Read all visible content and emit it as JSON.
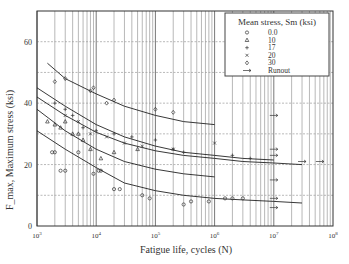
{
  "chart_data": {
    "type": "scatter",
    "title": "",
    "xlabel": "Fatigue life, cycles (N)",
    "ylabel": "F_max, Maximum stress (ksi)",
    "xscale": "log",
    "xlim": [
      1000,
      100000000
    ],
    "ylim": [
      0,
      70
    ],
    "x_ticks": [
      "10^3",
      "10^4",
      "10^5",
      "10^6",
      "10^7",
      "10^8"
    ],
    "y_ticks": [
      0,
      20,
      40,
      60
    ],
    "grid": true,
    "legend": {
      "title": "Mean stress, Sm (ksi)",
      "position": "upper right",
      "entries": [
        {
          "marker": "circle",
          "label": "0.0"
        },
        {
          "marker": "triangle",
          "label": "10"
        },
        {
          "marker": "plus",
          "label": "17"
        },
        {
          "marker": "x",
          "label": "20"
        },
        {
          "marker": "diamond",
          "label": "30"
        },
        {
          "marker": "arrow",
          "label": "Runout"
        }
      ]
    },
    "series": [
      {
        "name": "Sm=30 fit",
        "type": "line",
        "x": [
          1500,
          3000,
          10000,
          30000,
          100000,
          300000,
          1000000
        ],
        "y": [
          53,
          48,
          43,
          39,
          36,
          34,
          33
        ]
      },
      {
        "name": "Sm=20 fit",
        "type": "line",
        "x": [
          1000,
          3000,
          10000,
          30000,
          100000,
          300000,
          1000000,
          3000000,
          10000000
        ],
        "y": [
          45,
          39,
          33,
          29,
          26,
          24,
          23,
          22,
          21.5
        ]
      },
      {
        "name": "Sm=17 fit",
        "type": "line",
        "x": [
          1000,
          3000,
          10000,
          30000,
          100000,
          300000,
          1000000,
          3000000,
          10000000,
          30000000
        ],
        "y": [
          42,
          36,
          30.5,
          27,
          24.5,
          23,
          22,
          21,
          20.5,
          20
        ]
      },
      {
        "name": "Sm=10 fit",
        "type": "line",
        "x": [
          1000,
          3000,
          10000,
          30000,
          100000,
          300000,
          1000000
        ],
        "y": [
          38,
          31,
          25,
          21,
          18.5,
          17,
          16
        ]
      },
      {
        "name": "Sm=0 fit",
        "type": "line",
        "x": [
          1000,
          3000,
          10000,
          30000,
          100000,
          300000,
          1000000,
          3000000,
          10000000,
          30000000
        ],
        "y": [
          31,
          25,
          19,
          14,
          11.5,
          10,
          9,
          8.5,
          8,
          7.5
        ]
      },
      {
        "name": "Sm=0",
        "type": "points",
        "marker": "circle",
        "x": [
          1800,
          2000,
          2500,
          3000,
          5000,
          9000,
          11000,
          12000,
          20000,
          25000,
          60000,
          80000,
          300000,
          400000,
          800000,
          1500000,
          2000000,
          3000000
        ],
        "y": [
          24,
          24,
          18,
          18,
          24,
          17,
          18,
          18,
          12,
          12,
          10,
          9,
          7,
          8,
          8,
          9,
          9,
          9
        ]
      },
      {
        "name": "Sm=10",
        "type": "points",
        "marker": "triangle",
        "x": [
          1500,
          2000,
          2500,
          3000,
          4000,
          5000,
          6000,
          8000,
          12000,
          20000,
          50000
        ],
        "y": [
          34,
          33,
          32,
          34,
          30,
          30,
          28,
          25,
          22,
          24,
          25
        ]
      },
      {
        "name": "Sm=17",
        "type": "points",
        "marker": "plus",
        "x": [
          2000,
          3000,
          4000,
          6000,
          10000,
          20000,
          40000,
          100000,
          200000,
          300000,
          2000000,
          4000000
        ],
        "y": [
          40,
          38,
          36,
          32,
          31,
          30,
          29,
          28,
          25,
          24,
          23,
          22
        ]
      },
      {
        "name": "Sm=20",
        "type": "points",
        "marker": "x",
        "x": [
          3000,
          5000,
          8000,
          15000,
          30000,
          60000,
          200000,
          1000000
        ],
        "y": [
          36,
          34,
          30,
          29,
          27,
          26,
          25,
          27
        ]
      },
      {
        "name": "Sm=30",
        "type": "points",
        "marker": "diamond",
        "x": [
          2000,
          3000,
          8000,
          9000,
          15000,
          20000,
          100000,
          200000
        ],
        "y": [
          47,
          48,
          44,
          45,
          40,
          41,
          38,
          37
        ]
      },
      {
        "name": "Runout",
        "type": "points",
        "marker": "arrow",
        "x": [
          10000000,
          10000000,
          10000000,
          10000000,
          10000000,
          10000000,
          30000000,
          60000000
        ],
        "y": [
          36,
          25,
          23,
          15,
          9,
          6,
          21,
          21
        ]
      }
    ]
  }
}
